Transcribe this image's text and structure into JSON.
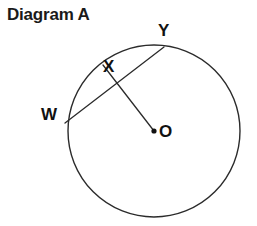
{
  "figure": {
    "title": "Diagram A",
    "background_color": "#ffffff",
    "stroke_color": "#2b2b2b",
    "label_color": "#111111",
    "width": 257,
    "height": 226
  },
  "circle": {
    "name": "circle-O",
    "center_label": "O",
    "center_x": 154,
    "center_y": 131,
    "radius": 86,
    "stroke_width": 1.4
  },
  "points": [
    {
      "id": "W",
      "label": "W",
      "x": 65,
      "y": 123,
      "on_circle": true,
      "label_x": 41,
      "label_y": 106
    },
    {
      "id": "X",
      "label": "X",
      "x": 113,
      "y": 80,
      "on_circle": false,
      "label_x": 103,
      "label_y": 58
    },
    {
      "id": "Y",
      "label": "Y",
      "x": 164,
      "y": 47,
      "on_circle": true,
      "label_x": 158,
      "label_y": 22
    },
    {
      "id": "O",
      "label": "O",
      "x": 154,
      "y": 131,
      "on_circle": false,
      "label_x": 159,
      "label_y": 123
    }
  ],
  "segments": [
    {
      "name": "chord-WY",
      "from": "W",
      "to": "Y",
      "x1": 65,
      "y1": 123,
      "x2": 164,
      "y2": 47
    },
    {
      "name": "radius-OX",
      "from": "O",
      "to": "X",
      "x1": 154,
      "y1": 131,
      "x2": 103,
      "y2": 65
    }
  ],
  "center_dot": {
    "name": "center-point-dot",
    "x": 154,
    "y": 131,
    "radius": 2.6
  }
}
